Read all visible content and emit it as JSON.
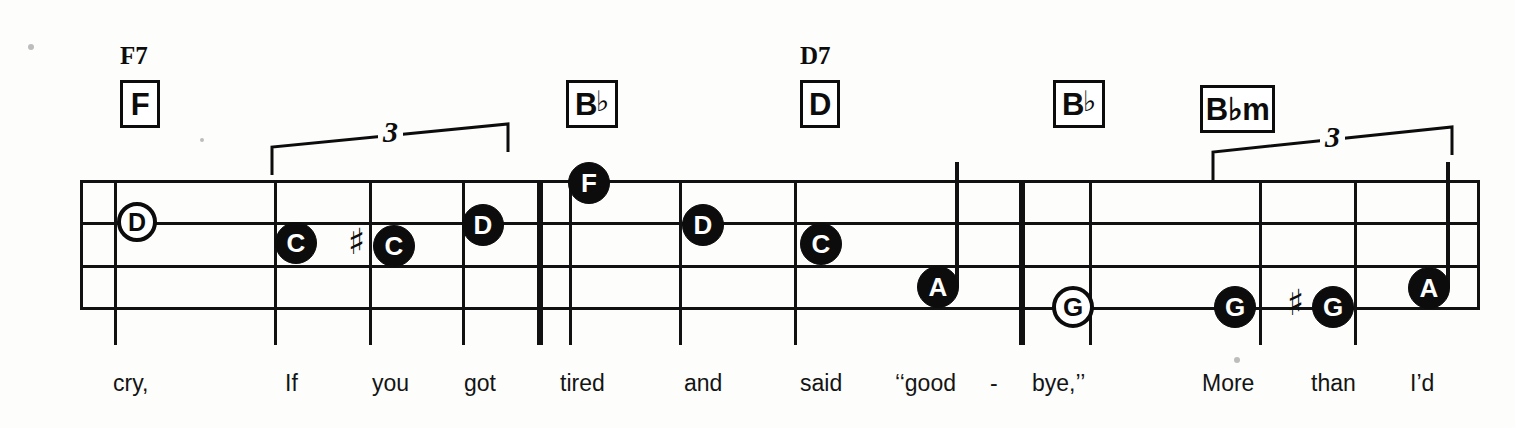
{
  "document": {
    "type": "sheet-music-staff",
    "kind": "lead-sheet-excerpt-with-lyrics",
    "background_color": "#fdfdfc",
    "ink_color": "#0c0c0c"
  },
  "staff": {
    "line_count": 4,
    "left": 80,
    "right": 1480,
    "line_ys": [
      180,
      222,
      265,
      307
    ],
    "barlines": [
      {
        "name": "barline-1",
        "x": 115,
        "thin": true
      },
      {
        "name": "barline-2",
        "x": 275,
        "thin": true
      },
      {
        "name": "barline-3",
        "x": 370,
        "thin": true
      },
      {
        "name": "barline-4",
        "x": 463,
        "thin": true
      },
      {
        "name": "double-barline",
        "x": 540,
        "thin": false
      },
      {
        "name": "barline-5",
        "x": 570,
        "thin": true
      },
      {
        "name": "barline-6",
        "x": 680,
        "thin": true
      },
      {
        "name": "barline-7",
        "x": 795,
        "thin": true
      },
      {
        "name": "heavy-barline",
        "x": 1022,
        "thin": false
      },
      {
        "name": "barline-8",
        "x": 1090,
        "thin": true
      },
      {
        "name": "barline-9",
        "x": 1260,
        "thin": true
      },
      {
        "name": "barline-10",
        "x": 1355,
        "thin": true
      }
    ]
  },
  "chords": [
    {
      "box_label": "F",
      "box_flat": "",
      "upper_name": "F7",
      "box_x": 120,
      "box_y": 80,
      "box_w": 40,
      "box_h": 48,
      "name_x": 120,
      "name_y": 42
    },
    {
      "box_label": "B",
      "box_flat": "♭",
      "upper_name": "",
      "box_x": 566,
      "box_y": 80,
      "box_w": 52,
      "box_h": 48,
      "name_x": 0,
      "name_y": 0
    },
    {
      "box_label": "D",
      "box_flat": "",
      "upper_name": "D7",
      "box_x": 800,
      "box_y": 80,
      "box_w": 40,
      "box_h": 48,
      "name_x": 800,
      "name_y": 42
    },
    {
      "box_label": "B",
      "box_flat": "♭",
      "upper_name": "",
      "box_x": 1053,
      "box_y": 80,
      "box_w": 52,
      "box_h": 48,
      "name_x": 0,
      "name_y": 0
    },
    {
      "box_label": "B♭m",
      "box_flat": "",
      "upper_name": "",
      "box_x": 1200,
      "box_y": 85,
      "box_w": 75,
      "box_h": 48,
      "name_x": 0,
      "name_y": 0
    }
  ],
  "notes": [
    {
      "name": "note-d-1",
      "label": "D",
      "style": "hollow",
      "cx": 137,
      "cy": 222,
      "d": 40,
      "stem": "none",
      "accidental": ""
    },
    {
      "name": "note-c-1",
      "label": "C",
      "style": "filled",
      "cx": 296,
      "cy": 243,
      "d": 42,
      "stem": "none",
      "accidental": ""
    },
    {
      "name": "note-c-sharp",
      "label": "C",
      "style": "filled",
      "cx": 394,
      "cy": 246,
      "d": 42,
      "stem": "none",
      "accidental": "♯"
    },
    {
      "name": "note-d-2",
      "label": "D",
      "style": "filled",
      "cx": 483,
      "cy": 225,
      "d": 42,
      "stem": "none",
      "accidental": ""
    },
    {
      "name": "note-f-1",
      "label": "F",
      "style": "filled",
      "cx": 589,
      "cy": 183,
      "d": 42,
      "stem": "none",
      "accidental": ""
    },
    {
      "name": "note-d-3",
      "label": "D",
      "style": "filled",
      "cx": 703,
      "cy": 225,
      "d": 42,
      "stem": "none",
      "accidental": ""
    },
    {
      "name": "note-c-2",
      "label": "C",
      "style": "filled",
      "cx": 821,
      "cy": 244,
      "d": 42,
      "stem": "none",
      "accidental": ""
    },
    {
      "name": "note-a-1",
      "label": "A",
      "style": "filled",
      "cx": 938,
      "cy": 287,
      "d": 42,
      "stem": "up",
      "accidental": ""
    },
    {
      "name": "note-g-1",
      "label": "G",
      "style": "hollow",
      "cx": 1073,
      "cy": 307,
      "d": 42,
      "stem": "none",
      "accidental": ""
    },
    {
      "name": "note-g-2",
      "label": "G",
      "style": "filled",
      "cx": 1235,
      "cy": 307,
      "d": 42,
      "stem": "none",
      "accidental": ""
    },
    {
      "name": "note-g-sharp",
      "label": "G",
      "style": "filled",
      "cx": 1333,
      "cy": 307,
      "d": 42,
      "stem": "none",
      "accidental": "♯"
    },
    {
      "name": "note-a-2",
      "label": "A",
      "style": "filled",
      "cx": 1429,
      "cy": 288,
      "d": 42,
      "stem": "up",
      "accidental": ""
    }
  ],
  "triplets": [
    {
      "name": "triplet-bracket-1",
      "digit": "3",
      "x1": 272,
      "x2": 508,
      "y_left": 147,
      "y_right": 124,
      "drop": 28,
      "digit_x": 378,
      "digit_y": 117
    },
    {
      "name": "triplet-bracket-2",
      "digit": "3",
      "x1": 1213,
      "x2": 1452,
      "y_left": 152,
      "y_right": 127,
      "drop": 28,
      "digit_x": 1320,
      "digit_y": 122
    }
  ],
  "lyrics": [
    {
      "name": "lyric-cry",
      "text": "cry,",
      "x": 113,
      "y": 370
    },
    {
      "name": "lyric-if",
      "text": "If",
      "x": 285,
      "y": 370
    },
    {
      "name": "lyric-you",
      "text": "you",
      "x": 372,
      "y": 370
    },
    {
      "name": "lyric-got",
      "text": "got",
      "x": 464,
      "y": 370
    },
    {
      "name": "lyric-tired",
      "text": "tired",
      "x": 560,
      "y": 370
    },
    {
      "name": "lyric-and",
      "text": "and",
      "x": 684,
      "y": 370
    },
    {
      "name": "lyric-said",
      "text": "said",
      "x": 800,
      "y": 370
    },
    {
      "name": "lyric-good",
      "text": "‘‘good",
      "x": 895,
      "y": 370
    },
    {
      "name": "lyric-hyphen",
      "text": "-",
      "x": 990,
      "y": 370
    },
    {
      "name": "lyric-bye",
      "text": "bye,’’",
      "x": 1032,
      "y": 370
    },
    {
      "name": "lyric-more",
      "text": "More",
      "x": 1202,
      "y": 370
    },
    {
      "name": "lyric-than",
      "text": "than",
      "x": 1311,
      "y": 370
    },
    {
      "name": "lyric-id",
      "text": "I’d",
      "x": 1410,
      "y": 370
    }
  ],
  "specks": [
    {
      "x": 28,
      "y": 44,
      "r": 3
    },
    {
      "x": 200,
      "y": 138,
      "r": 2
    },
    {
      "x": 1234,
      "y": 357,
      "r": 3
    }
  ]
}
